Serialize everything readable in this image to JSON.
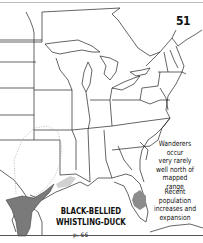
{
  "map": {
    "plate_number": "51",
    "species_title_line1": "BLACK-BELLIED",
    "species_title_line2": "WHISTLING-DUCK",
    "page_ref": "p. 66",
    "notes": [
      {
        "lines": [
          "Wanderers",
          "occur",
          "very rarely",
          "well north of",
          "mapped range"
        ]
      },
      {
        "lines": [
          "Recent",
          "population",
          "increases and",
          "expansion"
        ]
      }
    ],
    "colors": {
      "range_fill": "#7a7a7a",
      "expansion_fill": "#8c8c8c",
      "wanderer_dotted": "#aaaaaa",
      "border": "#222222",
      "background": "#ffffff"
    },
    "region": "Eastern United States"
  }
}
